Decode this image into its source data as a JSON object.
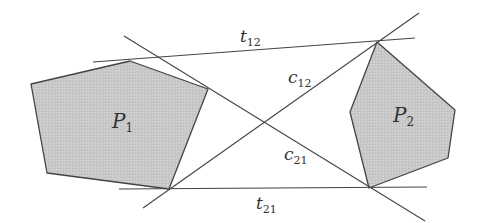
{
  "diagram": {
    "type": "geometry",
    "colors": {
      "background": "#ffffff",
      "polygon_fill": "#c8c8c8",
      "stroke": "#444444",
      "text": "#333333"
    },
    "polygons": [
      {
        "id": "P1",
        "label": "P",
        "subscript": "1",
        "points": [
          [
            31,
            84
          ],
          [
            130,
            61
          ],
          [
            208,
            89
          ],
          [
            169,
            189
          ],
          [
            47,
            173
          ]
        ],
        "label_pos": [
          112,
          128
        ]
      },
      {
        "id": "P2",
        "label": "P",
        "subscript": "2",
        "points": [
          [
            377,
            42
          ],
          [
            455,
            110
          ],
          [
            448,
            158
          ],
          [
            369,
            188
          ],
          [
            350,
            112
          ]
        ],
        "label_pos": [
          393,
          122
        ]
      }
    ],
    "lines": [
      {
        "id": "t12",
        "label": "t",
        "subscript": "12",
        "from": [
          93,
          62
        ],
        "to": [
          415,
          38
        ],
        "label_pos": [
          240,
          42
        ]
      },
      {
        "id": "t21",
        "label": "t",
        "subscript": "21",
        "from": [
          119,
          189
        ],
        "to": [
          427,
          187
        ],
        "label_pos": [
          256,
          209
        ]
      },
      {
        "id": "c12",
        "label": "c",
        "subscript": "12",
        "from": [
          143,
          208
        ],
        "to": [
          419,
          13
        ],
        "label_pos": [
          288,
          83
        ]
      },
      {
        "id": "c21",
        "label": "c",
        "subscript": "21",
        "from": [
          124,
          36
        ],
        "to": [
          425,
          221
        ],
        "label_pos": [
          284,
          160
        ]
      }
    ]
  }
}
